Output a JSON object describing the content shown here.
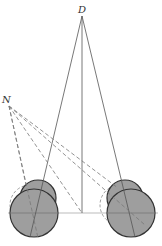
{
  "diagram": {
    "labels": {
      "top_point": "D",
      "left_point": "N"
    },
    "colors": {
      "stroke": "#555555",
      "fill": "#9e9e9e",
      "background": "#ffffff",
      "dashed": "#777777",
      "baseline": "#bbbbbb"
    },
    "points": {
      "D": [
        82,
        16
      ],
      "N": [
        9,
        106
      ],
      "baseline_center": [
        82,
        213
      ]
    },
    "left_wheel": {
      "big_center": [
        34,
        213
      ],
      "big_r": 24,
      "small_center": [
        38,
        202
      ],
      "small_r": 18
    },
    "right_wheel": {
      "big_center": [
        131,
        213
      ],
      "big_r": 24,
      "small_center": [
        125,
        202
      ],
      "small_r": 18
    }
  }
}
